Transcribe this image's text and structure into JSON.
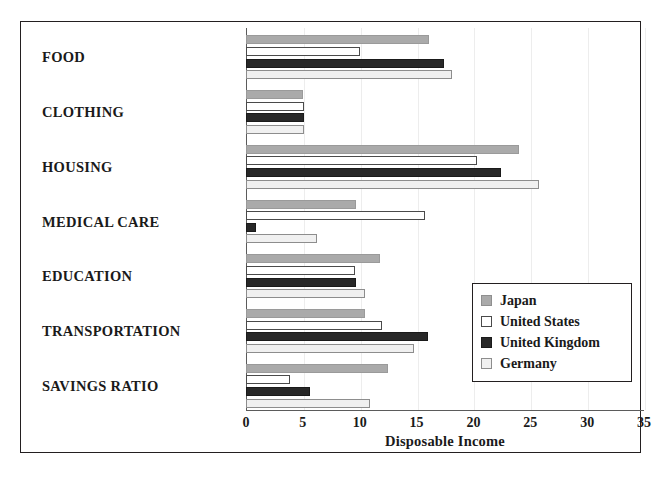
{
  "chart_data": {
    "type": "bar",
    "orientation": "horizontal",
    "title": "",
    "xlabel": "Disposable Income",
    "ylabel": "",
    "xlim": [
      0,
      35
    ],
    "xticks": [
      0,
      5,
      10,
      15,
      20,
      25,
      30,
      35
    ],
    "grid": true,
    "legend_position": "center-right",
    "categories": [
      "FOOD",
      "CLOTHING",
      "HOUSING",
      "MEDICAL CARE",
      "EDUCATION",
      "TRANSPORTATION",
      "SAVINGS RATIO"
    ],
    "series": [
      {
        "name": "Japan",
        "color": "#aaaaaa",
        "values": [
          16.1,
          5.0,
          24.0,
          9.7,
          11.8,
          10.5,
          12.5
        ]
      },
      {
        "name": "United States",
        "color": "#ffffff",
        "values": [
          10.0,
          5.1,
          20.3,
          15.7,
          9.6,
          12.0,
          3.9
        ]
      },
      {
        "name": "United Kingdom",
        "color": "#282828",
        "values": [
          17.4,
          5.1,
          22.4,
          0.9,
          9.7,
          16.0,
          5.6
        ]
      },
      {
        "name": "Germany",
        "color": "#f0f0f0",
        "values": [
          18.1,
          5.1,
          25.8,
          6.2,
          10.5,
          14.8,
          10.9
        ]
      }
    ]
  },
  "axis": {
    "xlabel_text": "Disposable Income",
    "tick_labels": [
      "0",
      "5",
      "10",
      "15",
      "20",
      "25",
      "30",
      "35"
    ]
  },
  "legend": {
    "entries": [
      {
        "label": "Japan",
        "swatch": "japan"
      },
      {
        "label": "United States",
        "swatch": "us"
      },
      {
        "label": "United Kingdom",
        "swatch": "uk"
      },
      {
        "label": "Germany",
        "swatch": "germany"
      }
    ]
  }
}
